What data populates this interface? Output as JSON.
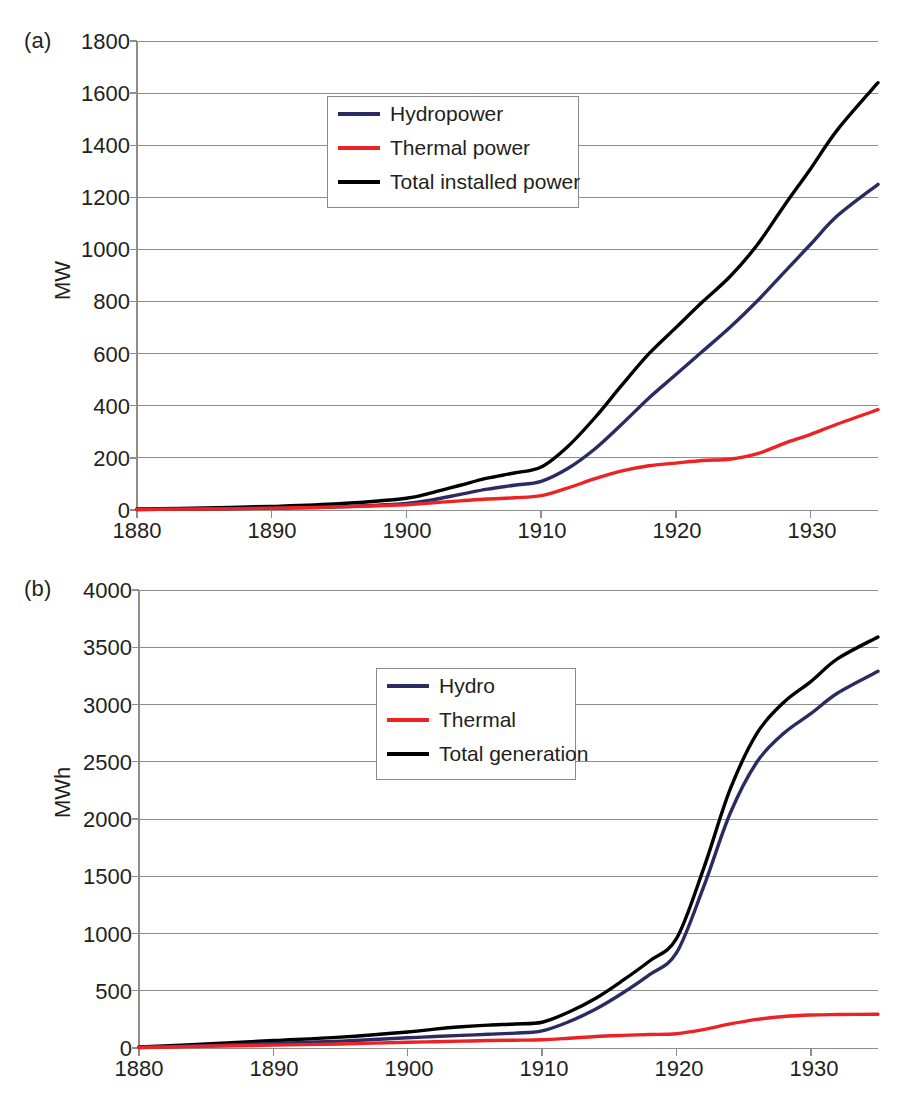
{
  "figure": {
    "panels": [
      {
        "tag": "(a)",
        "ylabel": "MW",
        "yticks": [
          "0",
          "200",
          "400",
          "600",
          "800",
          "1000",
          "1200",
          "1400",
          "1600",
          "1800"
        ],
        "xticks": [
          "1880",
          "1890",
          "1900",
          "1910",
          "1920",
          "1930"
        ],
        "legend": [
          {
            "label": "Hydropower",
            "color": "#2b2b63",
            "icon": "line-swatch-hydropower"
          },
          {
            "label": "Thermal power",
            "color": "#ed2224",
            "icon": "line-swatch-thermal-power"
          },
          {
            "label": "Total installed power",
            "color": "#000000",
            "icon": "line-swatch-total-installed-power"
          }
        ]
      },
      {
        "tag": "(b)",
        "ylabel": "MWh",
        "yticks": [
          "0",
          "500",
          "1000",
          "1500",
          "2000",
          "2500",
          "3000",
          "3500",
          "4000"
        ],
        "xticks": [
          "1880",
          "1890",
          "1900",
          "1910",
          "1920",
          "1930"
        ],
        "legend": [
          {
            "label": "Hydro",
            "color": "#2b2b63",
            "icon": "line-swatch-hydro"
          },
          {
            "label": "Thermal",
            "color": "#ed2224",
            "icon": "line-swatch-thermal"
          },
          {
            "label": "Total generation",
            "color": "#000000",
            "icon": "line-swatch-total-generation"
          }
        ]
      }
    ]
  },
  "chart_data": [
    {
      "type": "line",
      "panel": "(a)",
      "title": "",
      "xlabel": "",
      "ylabel": "MW",
      "xlim": [
        1880,
        1935
      ],
      "ylim": [
        0,
        1800
      ],
      "ytick_step": 200,
      "xtick_step": 10,
      "grid": true,
      "legend_position": "upper-center",
      "x": [
        1880,
        1885,
        1890,
        1895,
        1900,
        1902,
        1904,
        1906,
        1908,
        1910,
        1912,
        1914,
        1916,
        1918,
        1920,
        1922,
        1924,
        1926,
        1928,
        1930,
        1932,
        1935
      ],
      "series": [
        {
          "name": "Hydropower",
          "color": "#2b2b63",
          "values": [
            2,
            4,
            7,
            12,
            25,
            40,
            60,
            80,
            95,
            110,
            160,
            235,
            330,
            430,
            520,
            610,
            700,
            800,
            910,
            1020,
            1130,
            1250
          ]
        },
        {
          "name": "Thermal power",
          "color": "#ed2224",
          "values": [
            2,
            4,
            7,
            12,
            20,
            28,
            35,
            42,
            47,
            55,
            85,
            120,
            150,
            170,
            180,
            190,
            195,
            215,
            255,
            290,
            330,
            385
          ]
        },
        {
          "name": "Total installed power",
          "color": "#000000",
          "values": [
            4,
            8,
            14,
            24,
            45,
            68,
            95,
            122,
            142,
            165,
            245,
            355,
            480,
            600,
            700,
            800,
            895,
            1015,
            1165,
            1310,
            1460,
            1640
          ]
        }
      ]
    },
    {
      "type": "line",
      "panel": "(b)",
      "title": "",
      "xlabel": "",
      "ylabel": "MWh",
      "xlim": [
        1880,
        1935
      ],
      "ylim": [
        0,
        4000
      ],
      "ytick_step": 500,
      "xtick_step": 10,
      "grid": true,
      "legend_position": "center",
      "x": [
        1880,
        1885,
        1890,
        1895,
        1900,
        1902,
        1904,
        1906,
        1908,
        1910,
        1912,
        1914,
        1916,
        1918,
        1920,
        1922,
        1924,
        1926,
        1928,
        1930,
        1932,
        1935
      ],
      "series": [
        {
          "name": "Hydro",
          "color": "#2b2b63",
          "values": [
            5,
            20,
            40,
            60,
            90,
            100,
            110,
            120,
            130,
            150,
            230,
            340,
            480,
            640,
            830,
            1400,
            2050,
            2500,
            2750,
            2920,
            3100,
            3290
          ]
        },
        {
          "name": "Thermal",
          "color": "#ed2224",
          "values": [
            5,
            15,
            25,
            35,
            50,
            55,
            60,
            65,
            68,
            72,
            85,
            100,
            110,
            118,
            125,
            160,
            210,
            250,
            275,
            288,
            292,
            295
          ]
        },
        {
          "name": "Total generation",
          "color": "#000000",
          "values": [
            10,
            35,
            65,
            95,
            140,
            165,
            185,
            200,
            210,
            225,
            315,
            435,
            590,
            760,
            955,
            1560,
            2260,
            2750,
            3020,
            3200,
            3400,
            3590
          ]
        }
      ]
    }
  ]
}
